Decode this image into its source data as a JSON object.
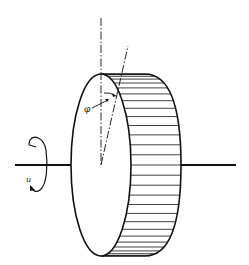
{
  "diagram": {
    "labels": {
      "angle": "φ",
      "rotation": "u"
    },
    "colors": {
      "stroke": "#111111",
      "background": "#ffffff"
    },
    "rim_stripe_count": 28
  }
}
